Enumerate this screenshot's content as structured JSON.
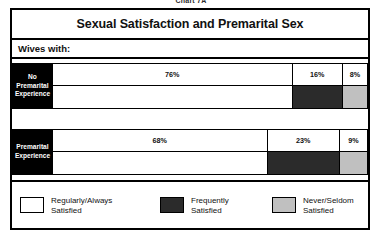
{
  "caption": "Chart 7A",
  "chart_data": {
    "type": "bar",
    "subtype": "stacked-horizontal-100",
    "title": "Sexual Satisfaction and Premarital Sex",
    "subhead": "Wives with:",
    "xlabel": "",
    "ylabel": "",
    "xlim": [
      0,
      100
    ],
    "grid": false,
    "legend_position": "bottom",
    "categories": [
      "No Premarital Experience",
      "Premarital Experience"
    ],
    "category_lines": [
      [
        "No",
        "Premarital",
        "Experience"
      ],
      [
        "Premarital",
        "Experience"
      ]
    ],
    "series": [
      {
        "name": "Regularly/Always Satisfied",
        "color": "#ffffff",
        "values": [
          76,
          68
        ],
        "labels": [
          "76%",
          "68%"
        ]
      },
      {
        "name": "Frequently Satisfied",
        "color": "#2b2b2b",
        "values": [
          16,
          23
        ],
        "labels": [
          "16%",
          "23%"
        ]
      },
      {
        "name": "Never/Seldom Satisfied",
        "color": "#c0c0c0",
        "values": [
          8,
          9
        ],
        "labels": [
          "8%",
          "9%"
        ]
      }
    ],
    "legend": [
      {
        "label_line1": "Regularly/Always",
        "label_line2": "Satisfied",
        "color": "#ffffff"
      },
      {
        "label_line1": "Frequently",
        "label_line2": "Satisfied",
        "color": "#2b2b2b"
      },
      {
        "label_line1": "Never/Seldom",
        "label_line2": "Satisfied",
        "color": "#c0c0c0"
      }
    ]
  },
  "colors": {
    "border": "#000000",
    "label_block_bg": "#000000",
    "label_block_text": "#ffffff",
    "segment_regularly": "#ffffff",
    "segment_frequently": "#2b2b2b",
    "segment_never": "#c0c0c0"
  }
}
